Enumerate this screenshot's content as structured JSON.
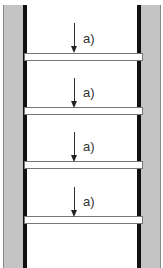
{
  "diagram": {
    "labels": [
      "a)",
      "a)",
      "a)",
      "a)"
    ],
    "colors": {
      "wall_fill": "#c4c4c4",
      "post": "#111111",
      "rung_fill": "#ffffff",
      "rung_border": "#777777",
      "arrow": "#222222",
      "label": "#333333"
    }
  }
}
